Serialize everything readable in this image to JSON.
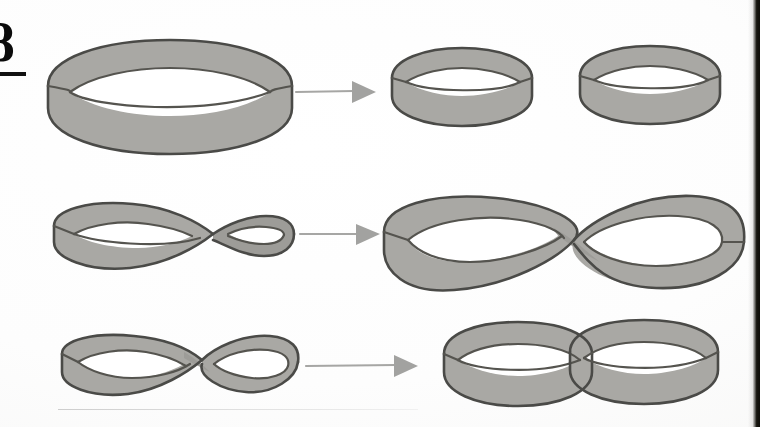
{
  "page": {
    "width": 760,
    "height": 427,
    "background_color": "#fdfdfc",
    "corner_glyph": "8",
    "gutter_color": "#16150f",
    "paper_description": "scanned textbook page"
  },
  "palette": {
    "band_fill": "#a9a8a4",
    "band_fill_shadow": "#9d9c98",
    "band_outline": "#4a4a47",
    "arrow_gray": "#a2a2a0",
    "ink_black": "#0b0b0b"
  },
  "figure": {
    "title": "",
    "caption": "",
    "rows": [
      {
        "id": "row-untwisted",
        "source": {
          "name": "untwisted-band",
          "label": "",
          "twists": 0,
          "cx": 175,
          "cy": 92
        },
        "arrow": {
          "name": "transform-arrow",
          "label": "",
          "x1": 296,
          "x2": 372,
          "y": 91
        },
        "result": {
          "name": "two-separate-rings",
          "label": "",
          "count": 2,
          "pieces": [
            "ring-left",
            "ring-right"
          ]
        }
      },
      {
        "id": "row-halftwist",
        "source": {
          "name": "half-twisted-band",
          "label": "",
          "twists": 1,
          "cx": 175,
          "cy": 235
        },
        "arrow": {
          "name": "transform-arrow",
          "label": "",
          "x1": 300,
          "x2": 376,
          "y": 233
        },
        "result": {
          "name": "single-long-twisted-band",
          "label": "",
          "count": 1,
          "pieces": [
            "figure-eight-band"
          ]
        }
      },
      {
        "id": "row-fulltwist",
        "source": {
          "name": "full-twisted-band",
          "label": "",
          "twists": 2,
          "cx": 180,
          "cy": 363
        },
        "arrow": {
          "name": "transform-arrow",
          "label": "",
          "x1": 306,
          "x2": 414,
          "y": 365
        },
        "result": {
          "name": "two-linked-rings",
          "label": "",
          "count": 2,
          "pieces": [
            "linked-ring-left",
            "linked-ring-right"
          ]
        }
      }
    ]
  }
}
